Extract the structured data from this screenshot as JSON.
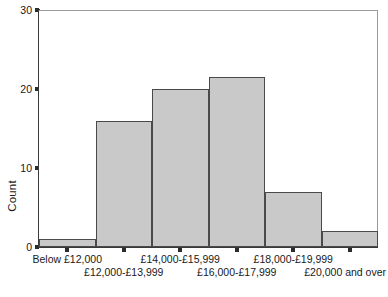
{
  "chart_data": {
    "type": "bar",
    "title": "",
    "subtitle": "",
    "xlabel": "",
    "ylabel": "Count",
    "categories": [
      "Below £12,000",
      "£12,000-£13,999",
      "£14,000-£15,999",
      "£16,000-£17,999",
      "£18,000-£19,999",
      "£20,000 and over"
    ],
    "values": [
      1,
      16,
      20,
      21.5,
      7,
      2
    ],
    "ylim": [
      0,
      30
    ],
    "yticks": [
      0,
      10,
      20,
      30
    ],
    "ytick_labels": [
      "0",
      "10",
      "20",
      "30"
    ],
    "grid": false,
    "legend": false,
    "legend_position": "none",
    "bar_fill_color": "#c9c9c9",
    "bar_edge_color": "#4a4a4a",
    "axis_color": "#3a3a3a",
    "frame_color": "#9a9a9a",
    "background_color": "#ffffff",
    "label_rows": [
      0,
      1,
      0,
      1,
      0,
      1
    ]
  }
}
